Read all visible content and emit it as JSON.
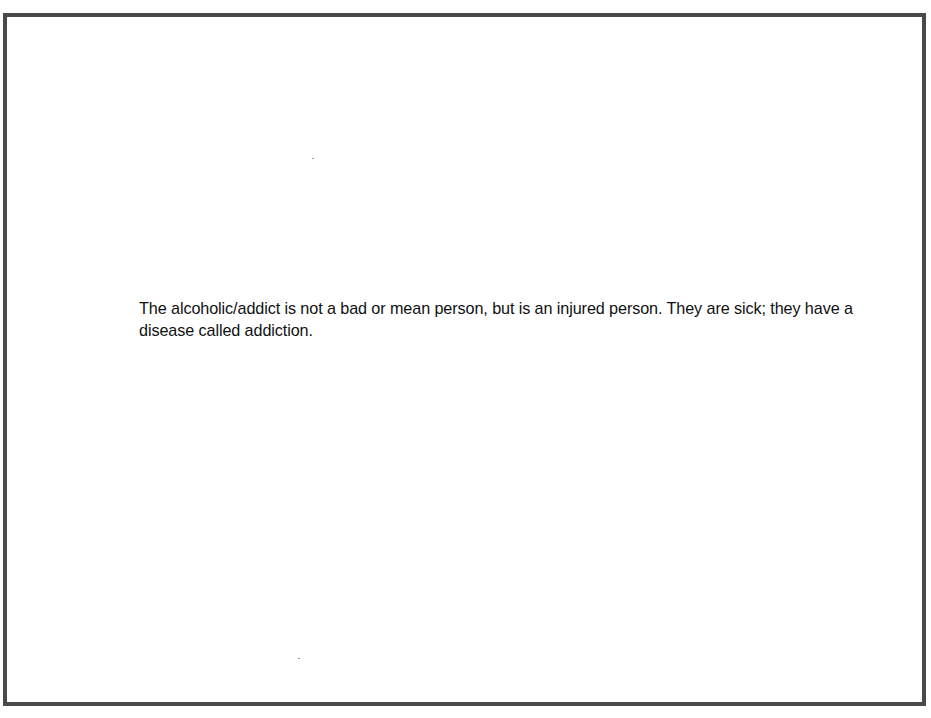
{
  "slide": {
    "body_text": "The alcoholic/addict is not a bad or mean person, but is an injured person. They are sick; they have a disease called addiction.",
    "border_color": "#4a4a4a",
    "background_color": "#ffffff"
  }
}
